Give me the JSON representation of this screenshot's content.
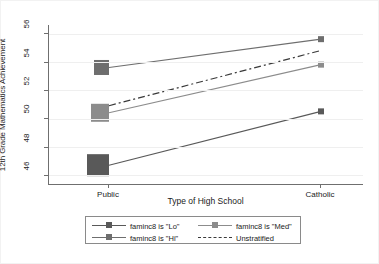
{
  "chart_data": {
    "type": "line",
    "title": "",
    "xlabel": "Type of High School",
    "ylabel": "12th Grade Mathematics Achievement",
    "categories": [
      "Public",
      "Catholic"
    ],
    "xticklabels": [
      "Public",
      "Catholic"
    ],
    "yticklabels": [
      "46",
      "48",
      "50",
      "52",
      "54",
      "56"
    ],
    "yticks": [
      46,
      48,
      50,
      52,
      54,
      56
    ],
    "ylim": [
      45.3,
      56.6
    ],
    "grid": "horizontal",
    "legend_position": "bottom-outside",
    "series": [
      {
        "name": "faminc8 is \"Lo\"",
        "values": [
          46.7,
          50.5
        ],
        "color": "#595959",
        "style": "solid",
        "marker": "square",
        "marker_sizes": [
          22,
          6
        ]
      },
      {
        "name": "faminc8 is \"Med\"",
        "values": [
          50.4,
          53.8
        ],
        "color": "#8c8c8c",
        "style": "solid",
        "marker": "square",
        "marker_sizes": [
          18,
          6
        ]
      },
      {
        "name": "faminc8 is \"Hi\"",
        "values": [
          53.6,
          55.6
        ],
        "color": "#6e6e6e",
        "style": "solid",
        "marker": "square",
        "marker_sizes": [
          15,
          6
        ]
      },
      {
        "name": "Unstratified",
        "values": [
          50.9,
          54.8
        ],
        "color": "#3a3a3a",
        "style": "dashed",
        "marker": "none",
        "marker_sizes": [
          0,
          0
        ]
      }
    ]
  },
  "legend": {
    "entries": [
      {
        "label": "faminc8 is \"Lo\"",
        "color": "#595959",
        "style": "solid",
        "marker": "square"
      },
      {
        "label": "faminc8 is \"Med\"",
        "color": "#8c8c8c",
        "style": "solid",
        "marker": "square"
      },
      {
        "label": "faminc8 is \"Hi\"",
        "color": "#6e6e6e",
        "style": "solid",
        "marker": "square"
      },
      {
        "label": "Unstratified",
        "color": "#3a3a3a",
        "style": "dashed",
        "marker": "none"
      }
    ]
  },
  "colors": {
    "axis": "#6f6f6f",
    "grid": "#efefef",
    "text": "#1a1a1a",
    "background": "#ffffff"
  }
}
